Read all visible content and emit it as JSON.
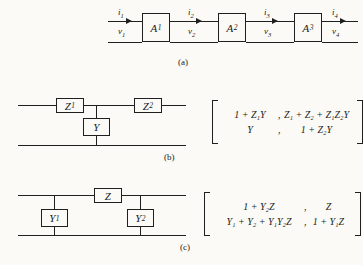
{
  "figure": {
    "background_color": "#fbfaf6",
    "ink_color": "#1f1f1f"
  },
  "panel_a": {
    "caption": "(a)",
    "blocks": [
      {
        "name": "A",
        "sub": "1"
      },
      {
        "name": "A",
        "sub": "2"
      },
      {
        "name": "A",
        "sub": "3"
      }
    ],
    "port_labels": [
      {
        "current": "i",
        "current_sub": "1",
        "voltage": "v",
        "voltage_sub": "1"
      },
      {
        "current": "i",
        "current_sub": "2",
        "voltage": "v",
        "voltage_sub": "2"
      },
      {
        "current": "i",
        "current_sub": "3",
        "voltage": "v",
        "voltage_sub": "3"
      },
      {
        "current": "i",
        "current_sub": "4",
        "voltage": "v",
        "voltage_sub": "4"
      }
    ]
  },
  "panel_b": {
    "caption": "(b)",
    "series_blocks": [
      {
        "name": "Z",
        "sub": "1"
      },
      {
        "name": "Z",
        "sub": "2"
      }
    ],
    "shunt_block": {
      "name": "Y",
      "sub": ""
    },
    "matrix": {
      "rows": [
        [
          {
            "text": "1 + Z",
            "sub": "1",
            "tail": "Y"
          },
          {
            "text": "Z",
            "sub": "1",
            "tail": " + Z",
            "sub2": "2",
            "tail2": " + Z",
            "sub3": "1",
            "tail3": "Z",
            "sub4": "2",
            "tail4": "Y"
          }
        ],
        [
          {
            "text": "Y",
            "sub": "",
            "tail": ""
          },
          {
            "text": "1 + Z",
            "sub": "2",
            "tail": "Y"
          }
        ]
      ],
      "row1_left": "1 + Z₁Y",
      "row1_right": "Z₁ + Z₂ + Z₁Z₂Y",
      "row2_left": "Y",
      "row2_right": "1 + Z₂Y",
      "comma": ","
    }
  },
  "panel_c": {
    "caption": "(c)",
    "series_block": {
      "name": "Z",
      "sub": ""
    },
    "shunt_blocks": [
      {
        "name": "Y",
        "sub": "1"
      },
      {
        "name": "Y",
        "sub": "2"
      }
    ],
    "matrix": {
      "row1_left": "1 + Y₂Z",
      "row1_right": "Z",
      "row2_left": "Y₁ + Y₂ + Y₁Y₂Z",
      "row2_right": "1 + Y₁Z",
      "comma": ","
    }
  }
}
